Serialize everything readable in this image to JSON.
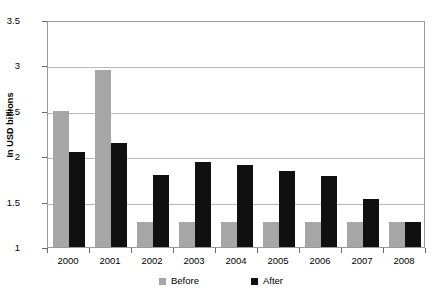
{
  "chart_data": {
    "type": "bar",
    "title": "",
    "subtitle": "",
    "xlabel": "",
    "ylabel": "In USD billions",
    "categories": [
      "2000",
      "2001",
      "2002",
      "2003",
      "2004",
      "2005",
      "2006",
      "2007",
      "2008"
    ],
    "series": [
      {
        "name": "Before",
        "color": "#a6a6a6",
        "values": [
          2.5,
          2.95,
          1.28,
          1.28,
          1.28,
          1.28,
          1.28,
          1.28,
          1.28
        ]
      },
      {
        "name": "After",
        "color": "#101010",
        "values": [
          2.05,
          2.15,
          1.79,
          1.94,
          1.9,
          1.84,
          1.78,
          1.53,
          1.28
        ]
      }
    ],
    "ylim": [
      1,
      3.5
    ],
    "yticks": [
      1,
      1.5,
      2,
      2.5,
      3,
      3.5
    ],
    "ytick_labels": [
      "1",
      "1.5",
      "2",
      "2.5",
      "3",
      "3.5"
    ],
    "grid": true,
    "grid_axis": "y",
    "legend_position": "bottom",
    "plot_background": "#ffffff",
    "grid_color": "#b8b8b8",
    "axis_color": "#9a9a9a"
  }
}
